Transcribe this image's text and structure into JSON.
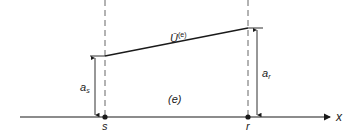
{
  "diagram": {
    "type": "linear-element-interpolation",
    "axis": {
      "label": "x"
    },
    "nodes": [
      {
        "id": "s",
        "label": "s",
        "height_label": "a",
        "height_sub": "s"
      },
      {
        "id": "r",
        "label": "r",
        "height_label": "a",
        "height_sub": "r"
      }
    ],
    "element_label": "(e)",
    "function_label": {
      "base": "Ū",
      "sup": "(e)"
    },
    "colors": {
      "line": "#1a1a1a",
      "dashed": "#555555",
      "background": "#ffffff"
    }
  }
}
